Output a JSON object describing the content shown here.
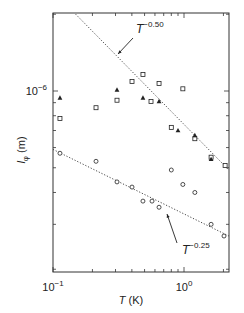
{
  "chart_data": {
    "type": "scatter",
    "title": "",
    "xlabel": "T (K)",
    "xlabel_italic_part": "T",
    "xlabel_unit": "(K)",
    "ylabel": "l_φ (m)",
    "ylabel_main": "l",
    "ylabel_sub": "φ",
    "ylabel_unit": "(m)",
    "xscale": "log",
    "yscale": "log",
    "xlim": [
      0.1,
      2.2
    ],
    "ylim": [
      1.95e-07,
      2e-06
    ],
    "grid": false,
    "legend": "none",
    "x_tick_labels": [
      {
        "value": 0.1,
        "base": "10",
        "exp": "−1"
      },
      {
        "value": 1.0,
        "base": "10",
        "exp": "0"
      }
    ],
    "y_tick_labels": [
      {
        "value": 1e-06,
        "base": "10",
        "exp": "−6"
      }
    ],
    "series": [
      {
        "name": "open squares",
        "marker": "square-open",
        "x": [
          0.113,
          0.213,
          0.308,
          0.401,
          0.486,
          0.56,
          0.645,
          0.98,
          0.8,
          1.21,
          1.61,
          2.06
        ],
        "y": [
          7.8e-07,
          8.6e-07,
          9.2e-07,
          1.09e-06,
          1.16e-06,
          9.1e-07,
          1.07e-06,
          1.02e-06,
          7.2e-07,
          6.5e-07,
          5.5e-07,
          5.1e-07
        ]
      },
      {
        "name": "filled triangles",
        "marker": "triangle-filled",
        "x": [
          0.113,
          0.308,
          0.486,
          0.645,
          0.9,
          1.21,
          1.61
        ],
        "y": [
          9.4e-07,
          1.01e-06,
          9.4e-07,
          9.1e-07,
          7e-07,
          6.7e-07,
          5.4e-07
        ]
      },
      {
        "name": "open circles",
        "marker": "circle-open",
        "x": [
          0.113,
          0.213,
          0.308,
          0.401,
          0.486,
          0.57,
          0.645,
          0.8,
          0.98,
          1.21,
          1.61,
          2.02
        ],
        "y": [
          5.7e-07,
          5.3e-07,
          4.4e-07,
          4.2e-07,
          3.7e-07,
          3.7e-07,
          3.5e-07,
          4.9e-07,
          4.3e-07,
          4e-07,
          3e-07,
          2.7e-07
        ]
      }
    ],
    "fit_lines": [
      {
        "name": "T^-0.50",
        "exponent": -0.5,
        "style": "dotted",
        "x": [
          0.149,
          2.2
        ],
        "y": [
          2e-06,
          4.9e-07
        ]
      },
      {
        "name": "T^-0.25",
        "exponent": -0.25,
        "style": "dotted",
        "x": [
          0.1,
          2.2
        ],
        "y": [
          5.9e-07,
          2.7e-07
        ]
      }
    ],
    "annotations": [
      {
        "text_base": "T",
        "text_exp": "−0.50",
        "label_at": [
          0.33,
          1.5e-06
        ],
        "arrow_to": [
          0.3,
          1.25e-06
        ]
      },
      {
        "text_base": "T",
        "text_exp": "−0.25",
        "label_at": [
          1.0,
          2.3e-07
        ],
        "arrow_to": [
          0.75,
          3.4e-07
        ]
      }
    ]
  },
  "colors": {
    "axis": "#333333",
    "marker": "#222222",
    "fit_line": "#333333"
  }
}
